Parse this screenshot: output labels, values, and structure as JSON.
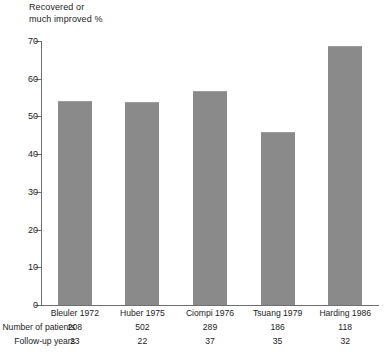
{
  "chart_data": {
    "type": "bar",
    "title": "",
    "ylabel": "Recovered or\nmuch improved %",
    "xlabel": "",
    "ylim": [
      0,
      70
    ],
    "yticks": [
      0,
      10,
      20,
      30,
      40,
      50,
      60,
      70
    ],
    "grid": false,
    "legend": false,
    "bar_color": "#8a8a8a",
    "categories": [
      "Bleuler 1972",
      "Huber 1975",
      "Ciompi 1976",
      "Tsuang 1979",
      "Harding 1986"
    ],
    "values": [
      54.0,
      53.7,
      56.7,
      46.0,
      68.7
    ],
    "annotations": {
      "row_labels": [
        "Number of patients",
        "Follow-up years"
      ],
      "number_of_patients": [
        208,
        502,
        289,
        186,
        118
      ],
      "follow_up_years": [
        23,
        22,
        37,
        35,
        32
      ]
    }
  }
}
